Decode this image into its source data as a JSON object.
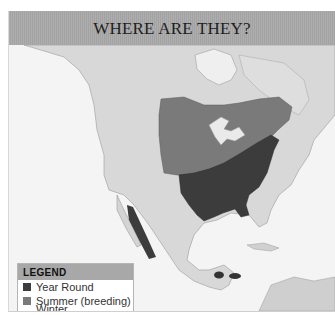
{
  "title": "WHERE ARE THEY?",
  "legend": {
    "heading": "LEGEND",
    "items": [
      {
        "label": "Year Round",
        "color": "#3c3c3c"
      },
      {
        "label": "Summer (breeding)",
        "color": "#7a7a7a"
      },
      {
        "label": "Winter (nonbreeding)",
        "color": "none"
      }
    ]
  },
  "map": {
    "region": "North and Central America",
    "colors": {
      "ocean": "#f4f4f4",
      "land": "#d9d9d9",
      "year_round": "#3c3c3c",
      "summer": "#7a7a7a"
    }
  }
}
